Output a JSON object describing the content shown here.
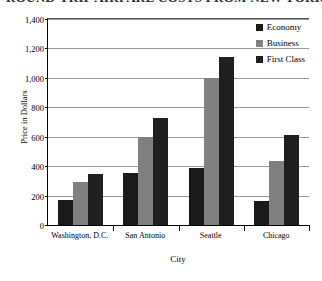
{
  "title": {
    "text": "ROUND-TRIP AIRFARE COSTS FROM NEW YORK",
    "clipped": "true"
  },
  "chart_data": {
    "type": "bar",
    "title": "ROUND-TRIP AIRFARE COSTS FROM NEW YORK",
    "xlabel": "City",
    "ylabel": "Price in Dollars",
    "ylim": [
      0,
      1400
    ],
    "ytick_step": 200,
    "grid": "horizontal",
    "legend_position": "top-right-inside",
    "categories": [
      "Washington, D.C.",
      "San Antonio",
      "Seattle",
      "Chicago"
    ],
    "series": [
      {
        "name": "Economy",
        "color": "#1a1a1a",
        "values": [
          170,
          355,
          390,
          165
        ]
      },
      {
        "name": "Business",
        "color": "#808080",
        "values": [
          290,
          595,
          1000,
          435
        ]
      },
      {
        "name": "First Class",
        "color": "#1f1f1f",
        "values": [
          345,
          725,
          1140,
          610
        ]
      }
    ],
    "ytick_labels": [
      "0",
      "200",
      "400",
      "600",
      "800",
      "1,000",
      "1,200",
      "1,400"
    ]
  },
  "axes": {
    "y": {
      "label": "Price in Dollars",
      "ticks": [
        {
          "value": 1400,
          "label": "1,400"
        },
        {
          "value": 1200,
          "label": "1,200"
        },
        {
          "value": 1000,
          "label": "1,000"
        },
        {
          "value": 800,
          "label": "800"
        },
        {
          "value": 600,
          "label": "600"
        },
        {
          "value": 400,
          "label": "400"
        },
        {
          "value": 200,
          "label": "200"
        },
        {
          "value": 0,
          "label": "0"
        }
      ]
    },
    "x": {
      "label": "City",
      "categories": [
        {
          "label": "Washington, D.C."
        },
        {
          "label": "San Antonio"
        },
        {
          "label": "Seattle"
        },
        {
          "label": "Chicago"
        }
      ]
    }
  },
  "legend": {
    "items": [
      {
        "label": "Economy",
        "color": "#1a1a1a"
      },
      {
        "label": "Business",
        "color": "#808080"
      },
      {
        "label": "First Class",
        "color": "#1f1f1f"
      }
    ]
  }
}
